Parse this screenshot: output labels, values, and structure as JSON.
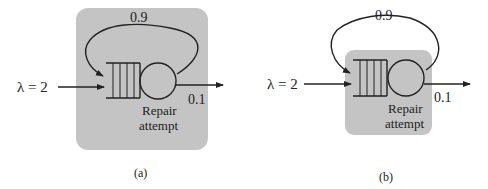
{
  "diagrams": [
    {
      "id": "a",
      "caption": "(a)",
      "arrival_label": "λ = 2",
      "feedback_prob": "0.9",
      "exit_prob": "0.1",
      "server_label_line1": "Repair",
      "server_label_line2": "attempt",
      "boundary": "encloses queue, server and feedback loop"
    },
    {
      "id": "b",
      "caption": "(b)",
      "arrival_label": "λ = 2",
      "feedback_prob": "0.9",
      "exit_prob": "0.1",
      "server_label_line1": "Repair",
      "server_label_line2": "attempt",
      "boundary": "encloses queue and server only"
    }
  ],
  "colors": {
    "box_fill": "#c4c4c4",
    "line": "#222222",
    "background": "#ffffff"
  }
}
